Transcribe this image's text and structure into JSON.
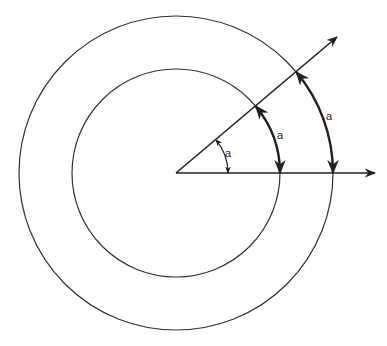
{
  "diagram": {
    "type": "angle-radian-illustration",
    "center": [
      176,
      173
    ],
    "angle_deg": 40,
    "circles": [
      {
        "name": "inner",
        "radius": 104
      },
      {
        "name": "outer",
        "radius": 157
      }
    ],
    "rays": [
      {
        "name": "horizontal-ray",
        "end": [
          375,
          173
        ]
      },
      {
        "name": "diagonal-ray",
        "end": [
          337,
          37
        ]
      }
    ],
    "labels": {
      "small_arc": "a",
      "inner_arc": "a",
      "outer_arc": "a"
    },
    "colors": {
      "stroke": "#222222",
      "background": "#ffffff"
    }
  }
}
